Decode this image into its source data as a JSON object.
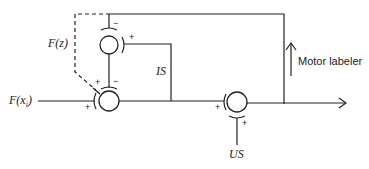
{
  "diagram": {
    "type": "block-diagram",
    "labels": {
      "input": "F(x",
      "input_sub": "i",
      "input_close": ")",
      "feedback_function": "F(z)",
      "internal_signal": "IS",
      "unconditioned_stimulus": "US",
      "motor_label": "Motor labeler"
    },
    "summing_nodes": [
      {
        "id": "upper",
        "signs": {
          "top": "−",
          "right": "+"
        }
      },
      {
        "id": "lower-left",
        "signs": {
          "top-left": "+",
          "top": "−",
          "left": "+"
        }
      },
      {
        "id": "right",
        "signs": {
          "left": "+",
          "bottom": "+"
        }
      }
    ],
    "colors": {
      "stroke": "#222222",
      "background": "#ffffff"
    }
  }
}
